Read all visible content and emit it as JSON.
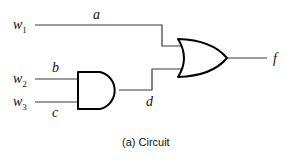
{
  "diagram": {
    "type": "logic-circuit",
    "inputs": [
      {
        "name": "w",
        "sub": "1",
        "signal": "a"
      },
      {
        "name": "w",
        "sub": "2",
        "signal": "b"
      },
      {
        "name": "w",
        "sub": "3",
        "signal": "c"
      }
    ],
    "gates": [
      {
        "type": "AND",
        "inputs": [
          "b",
          "c"
        ],
        "output": "d"
      },
      {
        "type": "OR",
        "inputs": [
          "a",
          "d"
        ],
        "output": "f"
      }
    ],
    "output": {
      "signal": "f"
    },
    "labels": {
      "a": "a",
      "b": "b",
      "c": "c",
      "d": "d",
      "f": "f"
    },
    "caption": "(a) Circuit"
  }
}
